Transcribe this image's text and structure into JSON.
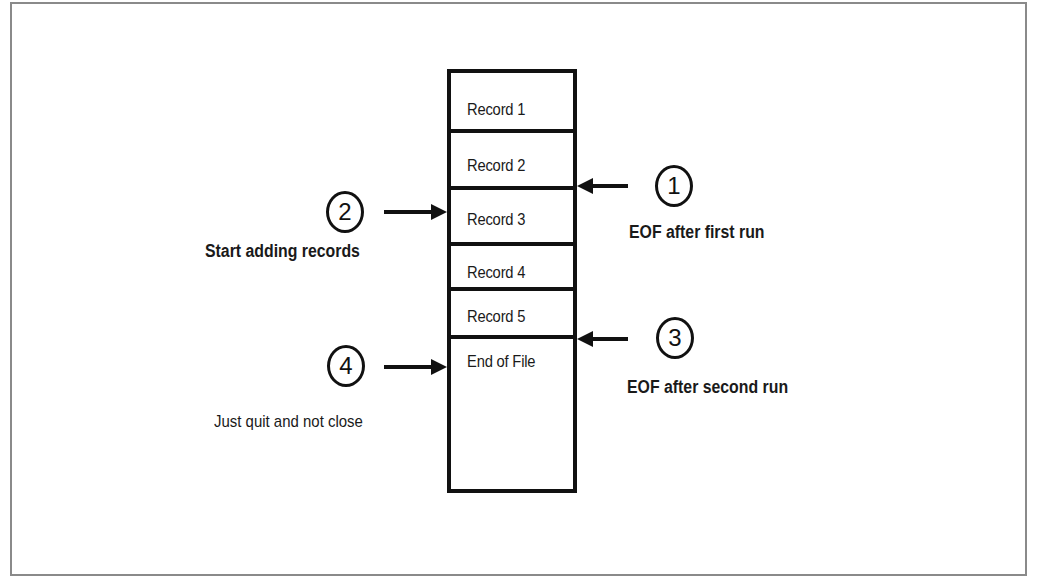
{
  "diagram": {
    "type": "sequential file pointer diagram",
    "file": {
      "records": [
        {
          "label": "Record 1"
        },
        {
          "label": "Record 2"
        },
        {
          "label": "Record 3"
        },
        {
          "label": "Record 4"
        },
        {
          "label": "Record 5"
        },
        {
          "label": "End of File"
        }
      ]
    },
    "markers": [
      {
        "number": "1",
        "caption": "EOF after first run",
        "side": "right",
        "points_to": "boundary between Record 2 and Record 3"
      },
      {
        "number": "2",
        "caption": "Start adding records",
        "side": "left",
        "points_to": "Record 3"
      },
      {
        "number": "3",
        "caption": "EOF after second run",
        "side": "right",
        "points_to": "boundary between Record 5 and End of File"
      },
      {
        "number": "4",
        "caption": "Just quit  and not close",
        "side": "left",
        "points_to": "End of File"
      }
    ],
    "colors": {
      "line": "#111111",
      "text": "#1a1a1a",
      "frame": "#8a8a8a",
      "background": "#ffffff"
    }
  }
}
